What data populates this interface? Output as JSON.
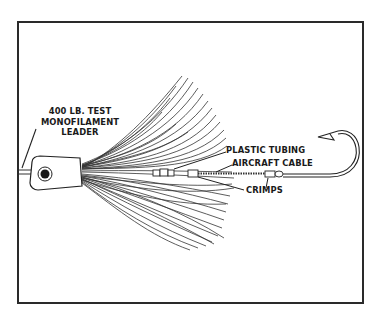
{
  "diagram": {
    "labels": {
      "leader_line1": "400 LB. TEST",
      "leader_line2": "MONOFILAMENT",
      "leader_line3": "LEADER",
      "plastic_tubing": "PLASTIC TUBING",
      "aircraft_cable": "AIRCRAFT CABLE",
      "crimps": "CRIMPS"
    },
    "components": [
      {
        "id": "leader",
        "name": "400 lb. test monofilament leader"
      },
      {
        "id": "lure-head",
        "name": "Lure head with eye"
      },
      {
        "id": "skirt",
        "name": "Skirt strands"
      },
      {
        "id": "plastic-tubing",
        "name": "Plastic tubing"
      },
      {
        "id": "aircraft-cable",
        "name": "Aircraft cable"
      },
      {
        "id": "crimps",
        "name": "Crimps"
      },
      {
        "id": "hook",
        "name": "Hook"
      }
    ],
    "colors": {
      "ink": "#1a1a1a",
      "frame": "#2a2a2a",
      "background": "#ffffff"
    }
  }
}
